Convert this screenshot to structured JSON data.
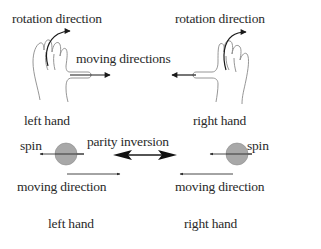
{
  "diagram": {
    "top_left": {
      "rotation_label": "rotation direction",
      "hand_label": "left hand"
    },
    "top_right": {
      "rotation_label": "rotation direction",
      "hand_label": "right hand"
    },
    "center_top": {
      "moving_label": "moving directions"
    },
    "bottom_left": {
      "spin_label": "spin",
      "moving_label": "moving direction",
      "hand_label": "left hand"
    },
    "bottom_right": {
      "spin_label": "spin",
      "moving_label": "moving direction",
      "hand_label": "right hand"
    },
    "center_bottom": {
      "parity_label": "parity inversion"
    },
    "colors": {
      "line": "#222222",
      "sphere": "#a8a8a8",
      "hand_outline": "#888888"
    }
  }
}
